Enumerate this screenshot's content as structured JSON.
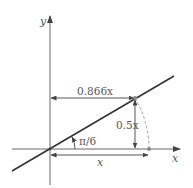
{
  "diagram": {
    "axes": {
      "x_label": "x",
      "y_label": "y"
    },
    "labels": {
      "horizontal_distance": "0.866x",
      "vertical_distance": "0.5x",
      "angle": "π/6",
      "base_length": "x"
    },
    "colors": {
      "line": "#333333",
      "axis": "#555555",
      "dashed_arc": "#888888",
      "text": "#555555"
    }
  }
}
